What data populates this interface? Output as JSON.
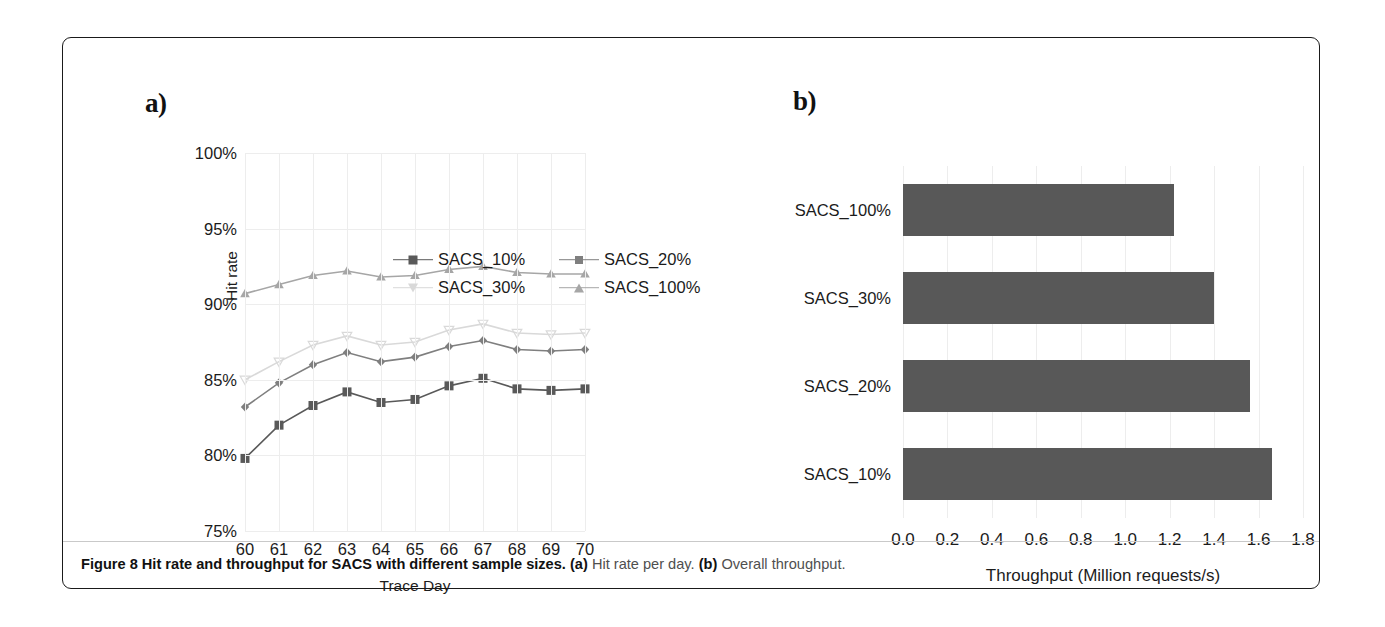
{
  "figure": {
    "panel_a_letter": "a)",
    "panel_b_letter": "b)",
    "caption_label": "Figure 8",
    "caption_title": "Hit rate and throughput for SACS with different sample sizes.",
    "caption_a_tag": "(a)",
    "caption_a_text": "Hit rate per day.",
    "caption_b_tag": "(b)",
    "caption_b_text": "Overall throughput."
  },
  "colors": {
    "series_10": "#595959",
    "series_20": "#7f7f7f",
    "series_30": "#d9d9d9",
    "series_100": "#a6a6a6",
    "bar_fill": "#585858",
    "grid": "#ededed",
    "text": "#1b1b1b",
    "frame": "#1a1a1a"
  },
  "chart_data": [
    {
      "type": "line",
      "panel": "a",
      "title": "",
      "xlabel": "Trace Day",
      "ylabel": "Hit rate",
      "x": [
        60,
        61,
        62,
        63,
        64,
        65,
        66,
        67,
        68,
        69,
        70
      ],
      "xtick_labels": [
        "60",
        "61",
        "62",
        "63",
        "64",
        "65",
        "66",
        "67",
        "68",
        "69",
        "70"
      ],
      "ytick_labels": [
        "100%",
        "95%",
        "90%",
        "85%",
        "80%",
        "75%"
      ],
      "ytick_values": [
        100,
        95,
        90,
        85,
        80,
        75
      ],
      "ylim": [
        75,
        100
      ],
      "yunit": "%",
      "grid": true,
      "legend_position": "top-right",
      "series": [
        {
          "name": "SACS_10%",
          "marker": "square",
          "color": "#595959",
          "values": [
            79.8,
            82.0,
            83.3,
            84.2,
            83.5,
            83.7,
            84.6,
            85.1,
            84.4,
            84.3,
            84.4
          ]
        },
        {
          "name": "SACS_20%",
          "marker": "diamond",
          "color": "#7f7f7f",
          "values": [
            83.2,
            84.8,
            86.0,
            86.8,
            86.2,
            86.5,
            87.2,
            87.6,
            87.0,
            86.9,
            87.0
          ]
        },
        {
          "name": "SACS_30%",
          "marker": "triangle-down",
          "color": "#d9d9d9",
          "values": [
            85.0,
            86.2,
            87.3,
            87.9,
            87.3,
            87.5,
            88.3,
            88.7,
            88.1,
            88.0,
            88.1
          ]
        },
        {
          "name": "SACS_100%",
          "marker": "triangle-up",
          "color": "#a6a6a6",
          "values": [
            90.7,
            91.3,
            91.9,
            92.2,
            91.8,
            91.9,
            92.3,
            92.5,
            92.1,
            92.0,
            92.0
          ]
        }
      ]
    },
    {
      "type": "bar",
      "panel": "b",
      "orientation": "horizontal",
      "title": "",
      "xlabel": "Throughput (Million requests/s)",
      "ylabel": "",
      "categories": [
        "SACS_100%",
        "SACS_30%",
        "SACS_20%",
        "SACS_10%"
      ],
      "values": [
        1.22,
        1.4,
        1.56,
        1.66
      ],
      "xlim": [
        0.0,
        1.8
      ],
      "xtick_labels": [
        "0.0",
        "0.2",
        "0.4",
        "0.6",
        "0.8",
        "1.0",
        "1.2",
        "1.4",
        "1.6",
        "1.8"
      ],
      "xtick_values": [
        0.0,
        0.2,
        0.4,
        0.6,
        0.8,
        1.0,
        1.2,
        1.4,
        1.6,
        1.8
      ],
      "grid": true,
      "legend_position": "none"
    }
  ]
}
